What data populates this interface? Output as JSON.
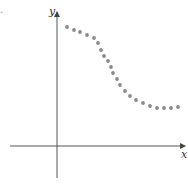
{
  "corner_mark": ".",
  "chart_data": {
    "type": "scatter",
    "title": "",
    "xlabel": "x",
    "ylabel": "y",
    "grid": false,
    "legend": null,
    "axes_px": {
      "origin": [
        57,
        146
      ],
      "x_axis": [
        10,
        185
      ],
      "y_axis": [
        178,
        12
      ]
    },
    "points_px": [
      [
        67,
        27
      ],
      [
        74,
        30
      ],
      [
        80,
        32
      ],
      [
        87,
        35
      ],
      [
        94,
        38
      ],
      [
        98,
        43
      ],
      [
        101,
        50
      ],
      [
        104,
        56
      ],
      [
        108,
        61
      ],
      [
        111,
        67
      ],
      [
        113,
        73
      ],
      [
        117,
        79
      ],
      [
        120,
        85
      ],
      [
        125,
        91
      ],
      [
        130,
        96
      ],
      [
        136,
        100
      ],
      [
        143,
        103
      ],
      [
        150,
        106
      ],
      [
        157,
        108
      ],
      [
        164,
        108
      ],
      [
        171,
        108
      ],
      [
        178,
        107
      ]
    ],
    "dot_color": "#8a8a8a",
    "axis_color": "#555555"
  }
}
